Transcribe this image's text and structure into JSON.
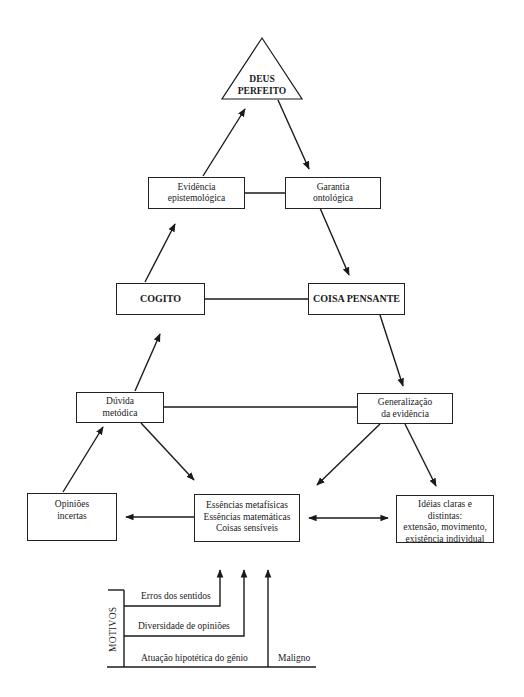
{
  "diagram": {
    "apex": {
      "lines": [
        "DEUS",
        "PERFEITO"
      ]
    },
    "nodes": {
      "evidencia": {
        "lines": [
          "Evidência",
          "epistemológica"
        ]
      },
      "garantia": {
        "lines": [
          "Garantia",
          "ontológica"
        ]
      },
      "cogito": {
        "lines": [
          "COGITO"
        ]
      },
      "coisa_pensante": {
        "lines": [
          "COISA PENSANTE"
        ]
      },
      "duvida": {
        "lines": [
          "Dúvida",
          "metódica"
        ]
      },
      "generalizacao": {
        "lines": [
          "Generalização",
          "da evidência"
        ]
      },
      "opinioes": {
        "lines": [
          "Opiniões",
          "incertas"
        ]
      },
      "essencias": {
        "lines": [
          "Essências metafísicas",
          "Essências matemáticas",
          "Coisas sensíveis"
        ]
      },
      "ideias": {
        "lines": [
          "Idéias claras e",
          "distintas:",
          "extensão, movimento,",
          "existência individual"
        ]
      }
    },
    "edges": [
      {
        "from": "opinioes",
        "to": "duvida",
        "type": "arrow"
      },
      {
        "from": "duvida",
        "to": "cogito",
        "type": "arrow"
      },
      {
        "from": "cogito",
        "to": "evidencia",
        "type": "arrow"
      },
      {
        "from": "evidencia",
        "to": "apex",
        "type": "arrow"
      },
      {
        "from": "apex",
        "to": "garantia",
        "type": "arrow"
      },
      {
        "from": "garantia",
        "to": "coisa_pensante",
        "type": "arrow"
      },
      {
        "from": "coisa_pensante",
        "to": "generalizacao",
        "type": "arrow"
      },
      {
        "from": "generalizacao",
        "to": "essencias",
        "type": "arrow"
      },
      {
        "from": "generalizacao",
        "to": "ideias",
        "type": "arrow"
      },
      {
        "from": "duvida",
        "to": "essencias",
        "type": "arrow"
      },
      {
        "from": "essencias",
        "to": "opinioes",
        "type": "arrow"
      },
      {
        "from": "essencias",
        "to": "ideias",
        "type": "double-arrow"
      },
      {
        "from": "evidencia",
        "to": "garantia",
        "type": "line"
      },
      {
        "from": "cogito",
        "to": "coisa_pensante",
        "type": "line"
      },
      {
        "from": "duvida",
        "to": "generalizacao",
        "type": "line"
      }
    ],
    "motivos": {
      "title": "MOTIVOS",
      "items": [
        "Erros dos sentidos",
        "Diversidade de opiniões",
        "Atuação hipotética do gênio"
      ],
      "trailing": "Maligno"
    }
  }
}
